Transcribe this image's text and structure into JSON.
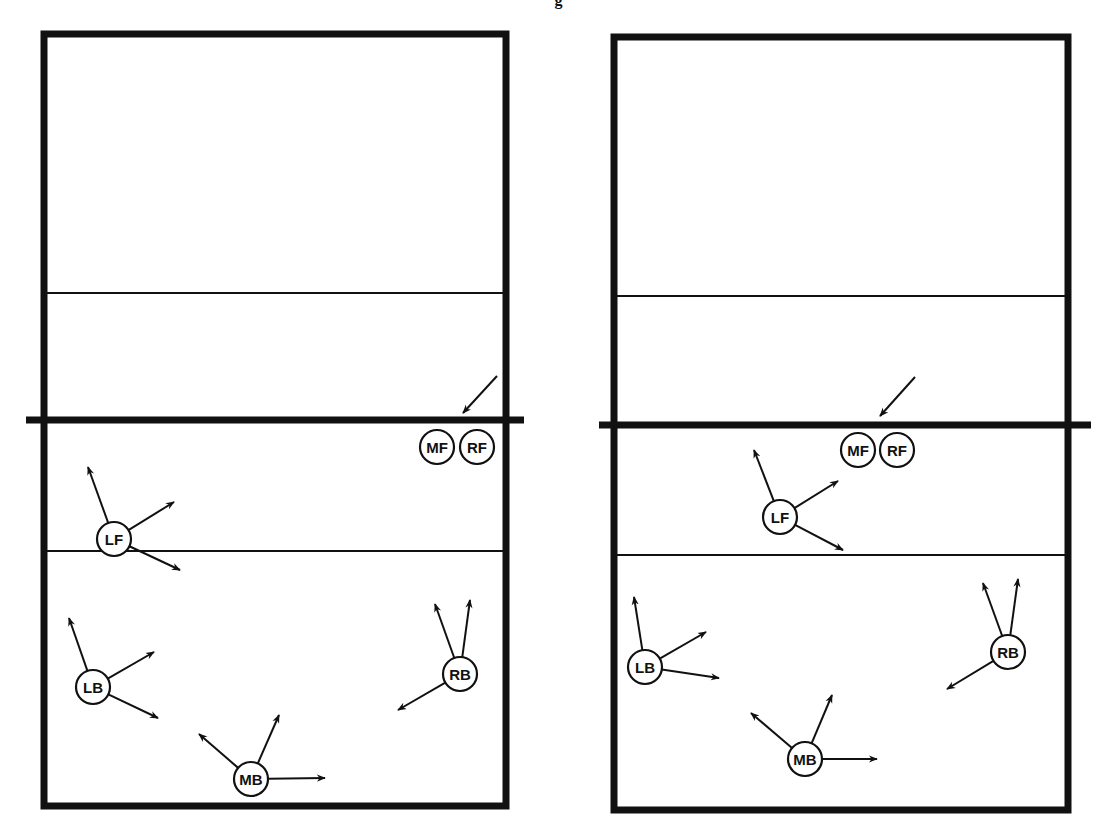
{
  "header": {
    "clipped_title_glyph": "g"
  },
  "style": {
    "ink": "#111111",
    "background": "#ffffff"
  },
  "diagrams": [
    {
      "id": "left",
      "court": {
        "x1": 44,
        "y1": 34,
        "x2": 506,
        "y2": 806,
        "border": 7
      },
      "net": {
        "x1": 26,
        "x2": 524,
        "y": 420,
        "thickness": 7
      },
      "lines": [
        {
          "y": 293
        },
        {
          "y": 551
        }
      ],
      "ball_arrow": {
        "from": [
          497,
          376
        ],
        "to": [
          463,
          413
        ]
      },
      "players": [
        {
          "label": "MF",
          "x": 437,
          "y": 447,
          "arrows": []
        },
        {
          "label": "RF",
          "x": 477,
          "y": 447,
          "arrows": []
        },
        {
          "label": "LF",
          "x": 114,
          "y": 539,
          "arrows": [
            [
              88,
              467
            ],
            [
              174,
              502
            ],
            [
              180,
              570
            ]
          ]
        },
        {
          "label": "LB",
          "x": 93,
          "y": 687,
          "arrows": [
            [
              69,
              618
            ],
            [
              154,
              652
            ],
            [
              158,
              718
            ]
          ]
        },
        {
          "label": "MB",
          "x": 251,
          "y": 779,
          "arrows": [
            [
              199,
              734
            ],
            [
              279,
              715
            ],
            [
              325,
              778
            ]
          ]
        },
        {
          "label": "RB",
          "x": 460,
          "y": 674,
          "arrows": [
            [
              435,
              604
            ],
            [
              470,
              600
            ],
            [
              398,
              710
            ]
          ]
        }
      ]
    },
    {
      "id": "right",
      "court": {
        "x1": 614,
        "y1": 37,
        "x2": 1068,
        "y2": 810,
        "border": 7
      },
      "net": {
        "x1": 599,
        "x2": 1091,
        "y": 425,
        "thickness": 7
      },
      "lines": [
        {
          "y": 296
        },
        {
          "y": 555
        }
      ],
      "ball_arrow": {
        "from": [
          915,
          377
        ],
        "to": [
          880,
          416
        ]
      },
      "players": [
        {
          "label": "MF",
          "x": 858,
          "y": 450,
          "arrows": []
        },
        {
          "label": "RF",
          "x": 897,
          "y": 450,
          "arrows": []
        },
        {
          "label": "LF",
          "x": 780,
          "y": 517,
          "arrows": [
            [
              754,
              450
            ],
            [
              838,
              481
            ],
            [
              843,
              550
            ]
          ]
        },
        {
          "label": "LB",
          "x": 645,
          "y": 667,
          "arrows": [
            [
              634,
              597
            ],
            [
              706,
              632
            ],
            [
              719,
              678
            ]
          ]
        },
        {
          "label": "MB",
          "x": 805,
          "y": 759,
          "arrows": [
            [
              751,
              713
            ],
            [
              832,
              695
            ],
            [
              877,
              759
            ]
          ]
        },
        {
          "label": "RB",
          "x": 1008,
          "y": 652,
          "arrows": [
            [
              983,
              583
            ],
            [
              1018,
              579
            ],
            [
              947,
              689
            ]
          ]
        }
      ]
    }
  ]
}
